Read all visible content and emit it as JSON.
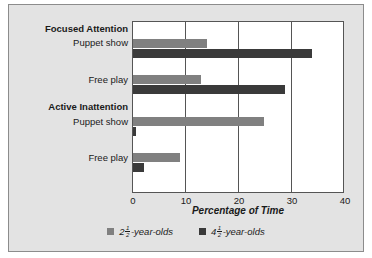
{
  "chart_data": {
    "type": "bar",
    "orientation": "horizontal",
    "title": "",
    "xlabel": "Percentage of Time",
    "ylabel": "",
    "xlim": [
      0,
      40
    ],
    "xticks": [
      0,
      10,
      20,
      30,
      40
    ],
    "grid": true,
    "legend_position": "bottom",
    "groups": [
      {
        "group_label": "Focused Attention",
        "categories": [
          "Puppet show",
          "Free play"
        ]
      },
      {
        "group_label": "Active Inattention",
        "categories": [
          "Puppet show",
          "Free play"
        ]
      }
    ],
    "categories": [
      "Focused Attention - Puppet show",
      "Focused Attention - Free play",
      "Active Inattention - Puppet show",
      "Active Inattention - Free play"
    ],
    "series": [
      {
        "name": "2 1/2 -year-olds",
        "color": "#808080",
        "values": [
          14,
          13,
          25,
          9
        ]
      },
      {
        "name": "4 1/2 -year-olds",
        "color": "#3a3a3a",
        "values": [
          34,
          29,
          0.5,
          2
        ]
      }
    ],
    "legend": [
      {
        "whole": "2",
        "num": "1",
        "den": "2",
        "suffix": "-year-olds",
        "color": "#808080"
      },
      {
        "whole": "4",
        "num": "1",
        "den": "2",
        "suffix": "-year-olds",
        "color": "#3a3a3a"
      }
    ]
  },
  "labels": {
    "group_focused": "Focused Attention",
    "group_inattention": "Active Inattention",
    "puppet_show": "Puppet show",
    "free_play": "Free play"
  },
  "axis": {
    "title": "Percentage of Time",
    "tick_0": "0",
    "tick_10": "10",
    "tick_20": "20",
    "tick_30": "30",
    "tick_40": "40"
  }
}
